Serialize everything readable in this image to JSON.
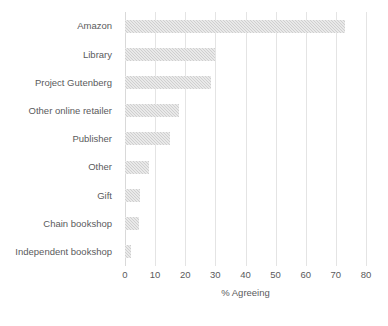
{
  "chart_data": {
    "type": "bar",
    "orientation": "horizontal",
    "title": "",
    "xlabel": "% Agreeing",
    "ylabel": "",
    "xlim": [
      0,
      80
    ],
    "xticks": [
      0,
      10,
      20,
      30,
      40,
      50,
      60,
      70,
      80
    ],
    "grid": "vertical",
    "legend": "none",
    "bar_color": "#cfcfcf",
    "categories": [
      "Amazon",
      "Library",
      "Project Gutenberg",
      "Other online retailer",
      "Publisher",
      "Other",
      "Gift",
      "Chain bookshop",
      "Independent bookshop"
    ],
    "values": [
      73,
      30,
      28.5,
      18,
      15,
      8,
      5,
      4.5,
      2
    ]
  }
}
